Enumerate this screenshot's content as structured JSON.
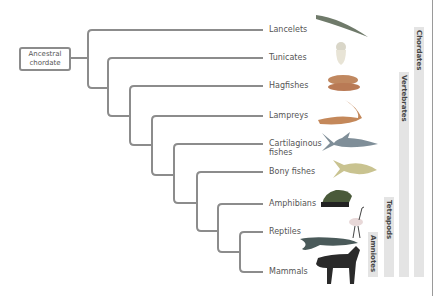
{
  "diagram": {
    "type": "cladogram",
    "root": {
      "label": "Ancestral chordate"
    },
    "taxa": [
      {
        "label": "Lancelets",
        "icon": "lancelet-icon"
      },
      {
        "label": "Tunicates",
        "icon": "tunicate-icon"
      },
      {
        "label": "Hagfishes",
        "icon": "hagfish-icon"
      },
      {
        "label": "Lampreys",
        "icon": "lamprey-icon"
      },
      {
        "label": "Cartilaginous fishes",
        "icon": "shark-icon"
      },
      {
        "label": "Bony fishes",
        "icon": "bony-fish-icon"
      },
      {
        "label": "Amphibians",
        "icon": "frog-icon"
      },
      {
        "label": "Reptiles",
        "icon": "reptile-icon"
      },
      {
        "label": "Mammals",
        "icon": "horse-icon"
      }
    ],
    "groups": [
      {
        "label": "Chordates"
      },
      {
        "label": "Vertebrates"
      },
      {
        "label": "Tetrapods"
      },
      {
        "label": "Amniotes"
      }
    ],
    "colors": {
      "branch": "#8c8c8c",
      "group_bar": "#e4e4e4",
      "text": "#555555"
    }
  }
}
